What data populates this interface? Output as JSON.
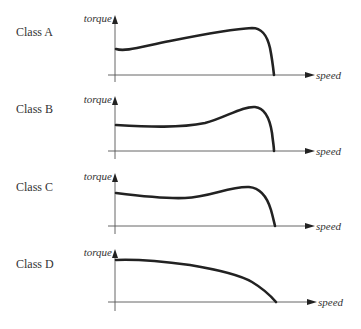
{
  "diagram": {
    "colors": {
      "curve": "#222222",
      "axis": "#555555",
      "text": "#333333",
      "background": "#ffffff"
    },
    "axes": {
      "y_label": "torque",
      "x_label": "speed"
    },
    "panels": [
      {
        "label": "Class A",
        "description": "Moderate starting torque rising gradually to a breakdown peak, then sharp drop to zero",
        "curve_path": "M116,49 C125,52 140,47 170,41 C200,35 230,29 252,28 C262,28 267,35 270,48 C272,58 273,66 274,75"
      },
      {
        "label": "Class B",
        "description": "Flat starting torque, dip, then pronounced peak before steep drop",
        "curve_path": "M116,125 C150,127 180,128 205,123 C225,118 242,106 255,107 C265,108 270,120 272,133 C273,142 274,147 274,151"
      },
      {
        "label": "Class C",
        "description": "High starting torque, slight sag, moderate peak, then drop",
        "curve_path": "M116,193 C140,196 165,199 185,198 C210,197 230,186 249,187 C262,188 268,200 271,210 C273,217 274,222 275,226"
      },
      {
        "label": "Class D",
        "description": "Highest starting torque, decreasing steadily with speed, no distinct peak",
        "curve_path": "M116,260 C140,259 160,261 190,265 C220,270 240,275 252,282 C262,288 270,295 276,302"
      }
    ]
  }
}
